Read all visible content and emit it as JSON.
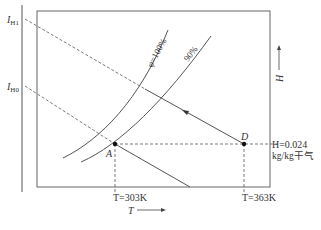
{
  "diagram": {
    "type": "psychrometric-chart (I-H diagram)",
    "axes": {
      "x_label": "T",
      "y_label": "H",
      "left_axis_labels": [
        {
          "symbol": "I",
          "subscript": "H1"
        },
        {
          "symbol": "I",
          "subscript": "H0"
        }
      ]
    },
    "curves": [
      {
        "label": "φ=100%"
      },
      {
        "label": "90%"
      }
    ],
    "points": {
      "A": {
        "label": "A",
        "T": "T=303K"
      },
      "D": {
        "label": "D",
        "T": "T=363K",
        "H_line1": "H=0.024",
        "H_line2": "kg/kg干气"
      }
    },
    "colors": {
      "line": "#555555",
      "text": "#333333"
    }
  },
  "labels": {
    "ih1_symbol": "I",
    "ih1_sub": "H1",
    "ih0_symbol": "I",
    "ih0_sub": "H0",
    "phi100": "φ=100%",
    "phi90": "90%",
    "point_a": "A",
    "point_d": "D",
    "t_a": "T=303K",
    "t_d": "T=363K",
    "h_value": "H=0.024",
    "h_unit": "kg/kg干气",
    "x_axis": "T",
    "y_axis": "H"
  }
}
